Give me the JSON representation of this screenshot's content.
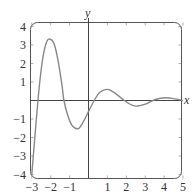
{
  "chart_data": {
    "type": "line",
    "title": "",
    "xlabel": "x",
    "ylabel": "y",
    "xlim": [
      -3,
      5
    ],
    "ylim": [
      -4,
      4
    ],
    "grid": false,
    "legend": null,
    "x_ticks": [
      -3,
      -2,
      -1,
      1,
      2,
      3,
      4,
      5
    ],
    "x_tick_labels": [
      "−3",
      "−2",
      "−1",
      "1",
      "2",
      "3",
      "4",
      "5"
    ],
    "y_ticks": [
      4,
      3,
      2,
      1,
      -1,
      -2,
      -3,
      -4
    ],
    "y_tick_labels": [
      "4",
      "3",
      "2",
      "1",
      "−1",
      "−2",
      "−3",
      "−4"
    ],
    "series": [
      {
        "name": "damped oscillation",
        "color": "#888888",
        "points": [
          [
            -3.0,
            -4.0
          ],
          [
            -2.8,
            -1.5
          ],
          [
            -2.6,
            0.8
          ],
          [
            -2.4,
            2.4
          ],
          [
            -2.2,
            3.2
          ],
          [
            -2.0,
            3.3
          ],
          [
            -1.8,
            3.0
          ],
          [
            -1.6,
            2.1
          ],
          [
            -1.4,
            0.8
          ],
          [
            -1.3,
            0.0
          ],
          [
            -1.1,
            -0.8
          ],
          [
            -0.9,
            -1.3
          ],
          [
            -0.7,
            -1.5
          ],
          [
            -0.5,
            -1.5
          ],
          [
            -0.3,
            -1.2
          ],
          [
            0.0,
            -0.6
          ],
          [
            0.3,
            0.0
          ],
          [
            0.6,
            0.45
          ],
          [
            1.0,
            0.6
          ],
          [
            1.4,
            0.4
          ],
          [
            1.9,
            0.0
          ],
          [
            2.3,
            -0.25
          ],
          [
            2.6,
            -0.3
          ],
          [
            3.0,
            -0.2
          ],
          [
            3.4,
            0.0
          ],
          [
            3.8,
            0.12
          ],
          [
            4.1,
            0.15
          ],
          [
            4.5,
            0.1
          ],
          [
            5.0,
            0.0
          ]
        ]
      }
    ],
    "annotations": []
  },
  "colors": {
    "curve": "#888888",
    "axes": "#444444",
    "frame": "#555555",
    "text": "#333333"
  }
}
